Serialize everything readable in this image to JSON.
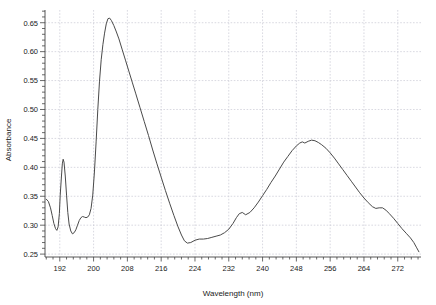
{
  "chart_data": {
    "type": "line",
    "title": "",
    "xlabel": "Wavelength (nm)",
    "ylabel": "Absorbance",
    "xlim": [
      188.5,
      277.5
    ],
    "ylim": [
      0.245,
      0.672
    ],
    "grid": true,
    "legend": null,
    "xticks": [
      192,
      200,
      208,
      216,
      224,
      232,
      240,
      248,
      256,
      264,
      272
    ],
    "xtick_labels": [
      "192",
      "200",
      "208",
      "216",
      "224",
      "232",
      "240",
      "248",
      "256",
      "264",
      "272"
    ],
    "yticks": [
      0.25,
      0.3,
      0.35,
      0.4,
      0.45,
      0.5,
      0.55,
      0.6,
      0.65
    ],
    "ytick_labels": [
      "0.25",
      "0.30",
      "0.35",
      "0.40",
      "0.45",
      "0.50",
      "0.55",
      "0.60",
      "0.65"
    ],
    "minor_tick_count_x": 4,
    "minor_tick_count_y": 5,
    "line_color": "#4a4a4a",
    "grid_color": "#c9c9d4",
    "axis_color": "#444444",
    "series": [
      {
        "name": "spectrum",
        "x": [
          188.8,
          189.3,
          189.8,
          190.2,
          190.6,
          191.0,
          191.3,
          191.6,
          191.9,
          192.1,
          192.4,
          192.6,
          192.8,
          193.0,
          193.3,
          193.6,
          193.9,
          194.2,
          194.6,
          195.0,
          195.4,
          195.8,
          196.2,
          196.6,
          197.0,
          197.4,
          197.8,
          198.2,
          198.6,
          199.0,
          199.4,
          199.8,
          200.2,
          200.6,
          201.0,
          201.4,
          201.8,
          202.2,
          202.6,
          203.0,
          203.4,
          203.8,
          204.2,
          204.8,
          205.4,
          206.0,
          206.8,
          207.6,
          208.4,
          209.2,
          210.0,
          211.0,
          212.0,
          213.0,
          214.0,
          215.0,
          216.0,
          217.0,
          218.0,
          219.0,
          220.0,
          220.8,
          221.5,
          222.2,
          223.0,
          224.0,
          225.0,
          226.0,
          227.0,
          228.0,
          229.0,
          230.0,
          231.0,
          232.0,
          233.0,
          233.8,
          234.5,
          235.2,
          236.0,
          237.0,
          238.0,
          239.0,
          240.0,
          241.0,
          242.0,
          243.0,
          244.0,
          245.0,
          246.0,
          247.0,
          248.0,
          248.8,
          249.4,
          250.0,
          250.8,
          251.6,
          252.4,
          253.2,
          254.0,
          255.0,
          256.0,
          257.0,
          258.0,
          259.0,
          260.0,
          261.0,
          262.0,
          263.0,
          264.0,
          265.0,
          266.0,
          266.8,
          267.6,
          268.4,
          269.2,
          270.0,
          271.0,
          272.0,
          273.0,
          274.0,
          275.0,
          275.8,
          276.4,
          277.0
        ],
        "y": [
          0.345,
          0.341,
          0.33,
          0.317,
          0.303,
          0.294,
          0.291,
          0.297,
          0.32,
          0.352,
          0.385,
          0.406,
          0.414,
          0.409,
          0.385,
          0.352,
          0.322,
          0.302,
          0.29,
          0.285,
          0.287,
          0.292,
          0.3,
          0.308,
          0.313,
          0.315,
          0.314,
          0.313,
          0.314,
          0.318,
          0.329,
          0.352,
          0.392,
          0.444,
          0.5,
          0.549,
          0.586,
          0.612,
          0.632,
          0.648,
          0.657,
          0.658,
          0.654,
          0.645,
          0.634,
          0.622,
          0.603,
          0.584,
          0.565,
          0.546,
          0.527,
          0.503,
          0.479,
          0.455,
          0.43,
          0.406,
          0.383,
          0.36,
          0.338,
          0.317,
          0.297,
          0.283,
          0.273,
          0.269,
          0.27,
          0.274,
          0.276,
          0.276,
          0.277,
          0.279,
          0.281,
          0.283,
          0.287,
          0.293,
          0.303,
          0.313,
          0.32,
          0.322,
          0.318,
          0.322,
          0.33,
          0.34,
          0.351,
          0.362,
          0.374,
          0.385,
          0.397,
          0.409,
          0.419,
          0.429,
          0.437,
          0.442,
          0.444,
          0.442,
          0.445,
          0.447,
          0.446,
          0.443,
          0.439,
          0.433,
          0.425,
          0.416,
          0.406,
          0.396,
          0.386,
          0.376,
          0.366,
          0.356,
          0.347,
          0.339,
          0.332,
          0.329,
          0.33,
          0.33,
          0.326,
          0.32,
          0.312,
          0.303,
          0.294,
          0.286,
          0.278,
          0.27,
          0.262,
          0.254
        ]
      }
    ]
  }
}
